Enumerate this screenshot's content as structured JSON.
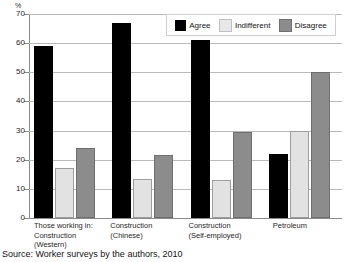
{
  "axis": {
    "unit_label": "%",
    "y_ticks": [
      "0",
      "10",
      "20",
      "30",
      "40",
      "50",
      "60",
      "70"
    ]
  },
  "legend": {
    "items": [
      {
        "label": "Agree",
        "key": "agree",
        "color": "#000000"
      },
      {
        "label": "Indifferent",
        "key": "indifferent",
        "color": "#e8e8e8"
      },
      {
        "label": "Disagree",
        "key": "disagree",
        "color": "#8c8c8c"
      }
    ]
  },
  "categories_display": [
    "Those working in:\nConstruction\n(Western)",
    "Construction\n(Chinese)",
    "Construction\n(Self-employed)",
    "Petroleum"
  ],
  "source": "Source: Worker surveys by the authors, 2010",
  "chart_data": {
    "type": "bar",
    "title": "",
    "subtitle": "",
    "xlabel": "",
    "ylabel": "%",
    "ylim": [
      0,
      70
    ],
    "ytick_interval": 10,
    "grid": true,
    "legend_position": "top-right",
    "categories": [
      "Those working in: Construction (Western)",
      "Construction (Chinese)",
      "Construction (Self-employed)",
      "Petroleum"
    ],
    "series": [
      {
        "name": "Agree",
        "color": "#000000",
        "values": [
          59,
          67,
          61,
          22
        ]
      },
      {
        "name": "Indifferent",
        "color": "#e8e8e8",
        "values": [
          17,
          13.5,
          13,
          30
        ]
      },
      {
        "name": "Disagree",
        "color": "#8c8c8c",
        "values": [
          24,
          21.5,
          29.5,
          50
        ]
      }
    ],
    "source": "Source: Worker surveys by the authors, 2010"
  }
}
